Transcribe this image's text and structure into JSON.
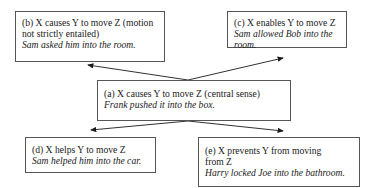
{
  "diagram": {
    "center": {
      "label": "(a) X causes Y to move Z (central sense)",
      "example": "Frank pushed it into the box."
    },
    "nodes": [
      {
        "id": "b",
        "label": "(b) X causes Y to move Z (motion not strictly entailed)",
        "example": "Sam asked him into the room."
      },
      {
        "id": "c",
        "label": "(c) X enables Y to move Z",
        "example": "Sam allowed Bob into the room."
      },
      {
        "id": "d",
        "label": "(d) X helps Y to move Z",
        "example": "Sam helped him into the car."
      },
      {
        "id": "e",
        "label": "(e) X prevents Y from moving from Z",
        "example": "Harry locked Joe into the bathroom."
      }
    ],
    "edges": [
      {
        "from": "a",
        "to": "b"
      },
      {
        "from": "a",
        "to": "c"
      },
      {
        "from": "a",
        "to": "d"
      },
      {
        "from": "a",
        "to": "e"
      }
    ],
    "colors": {
      "line": "#1a1a1a",
      "border": "#555555",
      "background": "#ffffff"
    }
  }
}
